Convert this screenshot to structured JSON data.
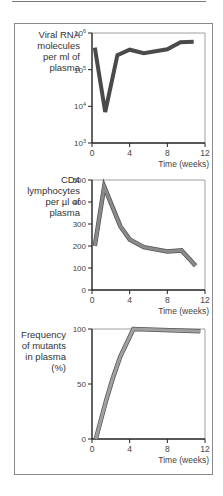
{
  "chart_data": [
    {
      "type": "line",
      "title": "",
      "ylabel": "Viral RNA molecules per ml of plasma",
      "xlabel": "Time (weeks)",
      "yscale": "log",
      "ylim": [
        1000,
        1000000
      ],
      "xlim": [
        0,
        12
      ],
      "yticks": [
        "10^3",
        "10^4",
        "10^5",
        "10^6"
      ],
      "xticks": [
        "0",
        "4",
        "8",
        "12"
      ],
      "x": [
        0.3,
        1.4,
        2.7,
        4,
        5.5,
        8,
        9.4,
        10.8
      ],
      "values": [
        400000,
        7000,
        250000,
        350000,
        280000,
        360000,
        560000,
        580000
      ],
      "color": "#4a4a4a"
    },
    {
      "type": "line",
      "title": "",
      "ylabel": "CD4 lymphocytes per µl of plasma",
      "xlabel": "Time (weeks)",
      "ylim": [
        0,
        500
      ],
      "xlim": [
        0,
        12
      ],
      "yticks": [
        "0",
        "100",
        "200",
        "300",
        "400",
        "500"
      ],
      "xticks": [
        "0",
        "4",
        "8",
        "12"
      ],
      "x": [
        0.3,
        1.3,
        3,
        4,
        5.5,
        8,
        9.5,
        11
      ],
      "values": [
        200,
        470,
        290,
        230,
        195,
        175,
        180,
        110
      ],
      "color": "#8a8a8a"
    },
    {
      "type": "line",
      "title": "",
      "ylabel": "Frequency of mutants in plasma (%)",
      "xlabel": "Time (weeks)",
      "ylim": [
        0,
        100
      ],
      "xlim": [
        0,
        12
      ],
      "yticks": [
        "0",
        "50",
        "100"
      ],
      "xticks": [
        "0",
        "4",
        "8",
        "12"
      ],
      "x": [
        0.4,
        1.5,
        2.2,
        3,
        4.4,
        11.5
      ],
      "values": [
        0,
        35,
        55,
        75,
        100,
        98
      ],
      "color": "#a0a0a0"
    }
  ],
  "labels": {
    "chart1": [
      "Viral RNA",
      "molecules",
      "per ml of",
      "plasma"
    ],
    "chart2": [
      "CD4",
      "lymphocytes",
      "per µl of",
      "plasma"
    ],
    "chart3": [
      "Frequency",
      "of mutants",
      "in plasma",
      "(%)"
    ],
    "xlabel": "Time (weeks)"
  }
}
